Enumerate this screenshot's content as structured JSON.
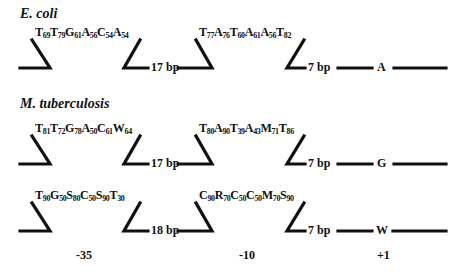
{
  "organisms": {
    "ecoli": "E. coli",
    "mtb": "M. tuberculosis"
  },
  "rows": [
    {
      "minus35": [
        [
          "T",
          "69"
        ],
        [
          "T",
          "79"
        ],
        [
          "G",
          "61"
        ],
        [
          "A",
          "56"
        ],
        [
          "C",
          "54"
        ],
        [
          "A",
          "54"
        ]
      ],
      "spacer": "17 bp",
      "minus10": [
        [
          "T",
          "77"
        ],
        [
          "A",
          "76"
        ],
        [
          "T",
          "60"
        ],
        [
          "A",
          "61"
        ],
        [
          "A",
          "56"
        ],
        [
          "T",
          "82"
        ]
      ],
      "gap": "7 bp",
      "start": "A"
    },
    {
      "minus35": [
        [
          "T",
          "81"
        ],
        [
          "T",
          "72"
        ],
        [
          "G",
          "78"
        ],
        [
          "A",
          "50"
        ],
        [
          "C",
          "61"
        ],
        [
          "W",
          "64"
        ]
      ],
      "spacer": "17 bp",
      "minus10": [
        [
          "T",
          "80"
        ],
        [
          "A",
          "90"
        ],
        [
          "T",
          "39"
        ],
        [
          "A",
          "43"
        ],
        [
          "M",
          "71"
        ],
        [
          "T",
          "86"
        ]
      ],
      "gap": "7 bp",
      "start": "G"
    },
    {
      "minus35": [
        [
          "T",
          "90"
        ],
        [
          "G",
          "50"
        ],
        [
          "S",
          "80"
        ],
        [
          "C",
          "50"
        ],
        [
          "S",
          "90"
        ],
        [
          "T",
          "30"
        ]
      ],
      "spacer": "18 bp",
      "minus10": [
        [
          "C",
          "90"
        ],
        [
          "R",
          "70"
        ],
        [
          "C",
          "50"
        ],
        [
          "C",
          "50"
        ],
        [
          "M",
          "70"
        ],
        [
          "S",
          "90"
        ]
      ],
      "gap": "7 bp",
      "start": "W"
    }
  ],
  "positions": {
    "minus35": "-35",
    "minus10": "-10",
    "plus1": "+1"
  }
}
